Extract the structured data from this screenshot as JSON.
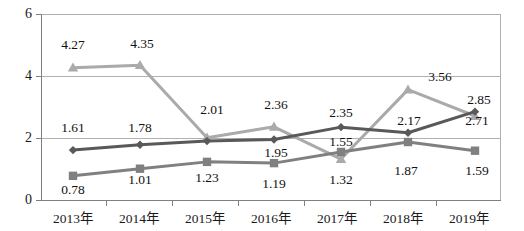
{
  "chart_data": {
    "type": "line",
    "title": "",
    "xlabel": "",
    "ylabel": "",
    "categories": [
      "2013年",
      "2014年",
      "2015年",
      "2016年",
      "2017年",
      "2018年",
      "2019年"
    ],
    "ylim": [
      0,
      6
    ],
    "yticks": [
      0,
      2,
      4,
      6
    ],
    "ytick_labels": [
      "0",
      "2",
      "4",
      "6"
    ],
    "grid": true,
    "legend": "none",
    "series": [
      {
        "name": "series-1",
        "marker": "diamond",
        "color": "#595959",
        "values": [
          1.61,
          1.78,
          1.9,
          1.95,
          2.35,
          2.17,
          2.85
        ],
        "labels": [
          "1.61",
          "1.78",
          "",
          "1.95",
          "2.35",
          "2.17",
          "2.85"
        ]
      },
      {
        "name": "series-2",
        "marker": "square",
        "color": "#808080",
        "values": [
          0.78,
          1.01,
          1.23,
          1.19,
          1.55,
          1.87,
          1.59
        ],
        "labels": [
          "0.78",
          "1.01",
          "1.23",
          "1.19",
          "1.55",
          "1.87",
          "1.59"
        ]
      },
      {
        "name": "series-3",
        "marker": "triangle",
        "color": "#aaaaaa",
        "values": [
          4.27,
          4.35,
          2.01,
          2.36,
          1.32,
          3.56,
          2.71
        ],
        "labels": [
          "4.27",
          "4.35",
          "2.01",
          "2.36",
          "1.32",
          "3.56",
          "2.71"
        ]
      }
    ]
  },
  "colors": {
    "series_1": "#595959",
    "series_2": "#808080",
    "series_3": "#aaaaaa",
    "grid": "#b0b0b0",
    "axis": "#808080",
    "text": "#1a1a1a",
    "background": "#ffffff"
  }
}
